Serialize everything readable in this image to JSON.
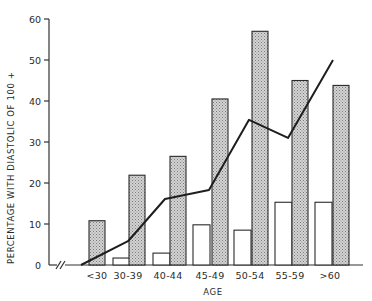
{
  "chart_data": {
    "type": "bar",
    "title": "",
    "xlabel": "AGE",
    "ylabel": "PERCENTAGE WITH DIASTOLIC OF 100 +",
    "ylim": [
      0,
      60
    ],
    "yticks": [
      0,
      10,
      20,
      30,
      40,
      50,
      60
    ],
    "grid": false,
    "legend": null,
    "axis_break": "x-axis break marks (//) near origin",
    "categories": [
      "<30",
      "30-39",
      "40-44",
      "45-49",
      "50-54",
      "55-59",
      ">60"
    ],
    "series": [
      {
        "name": "white bars",
        "type": "bar",
        "style": "white",
        "values": [
          0,
          1.7,
          2.9,
          9.8,
          8.5,
          15.3,
          15.3
        ]
      },
      {
        "name": "shaded bars",
        "type": "bar",
        "style": "stippled",
        "values": [
          10.8,
          21.9,
          26.5,
          40.5,
          57.0,
          45.0,
          43.8
        ]
      },
      {
        "name": "trend line",
        "type": "line",
        "values": [
          0,
          5.8,
          16.1,
          18.3,
          35.4,
          31.0,
          50.0
        ]
      }
    ]
  },
  "layout": {
    "origin_x": 49,
    "baseline_y": 265,
    "px_per_unit": 4.1,
    "axis_end_x": 363,
    "group_white_x": [
      73,
      113,
      153,
      193,
      234,
      275,
      315
    ],
    "group_shaded_x": [
      89,
      129,
      170,
      212,
      252,
      292,
      333
    ],
    "bar_width": 17,
    "line_x": [
      81,
      128,
      165,
      209,
      249,
      288,
      333
    ],
    "label_x": [
      97,
      128,
      168,
      210,
      250,
      290,
      330
    ]
  }
}
